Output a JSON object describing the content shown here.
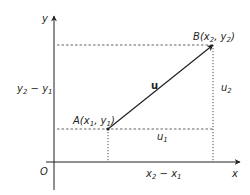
{
  "diagram": {
    "axes": {
      "x_label": "x",
      "y_label": "y",
      "origin_label": "O"
    },
    "points": {
      "A": {
        "name": "A",
        "x_var": "x",
        "x_sub": "1",
        "y_var": "y",
        "y_sub": "1"
      },
      "B": {
        "name": "B",
        "x_var": "x",
        "x_sub": "2",
        "y_var": "y",
        "y_sub": "2"
      }
    },
    "vector_label": "u",
    "components": {
      "u1": {
        "var": "u",
        "sub": "1"
      },
      "u2": {
        "var": "u",
        "sub": "2"
      }
    },
    "differences": {
      "horizontal": {
        "a": "x",
        "a_sub": "2",
        "minus": " − ",
        "b": "x",
        "b_sub": "1"
      },
      "vertical": {
        "a": "y",
        "a_sub": "2",
        "minus": " − ",
        "b": "y",
        "b_sub": "1"
      }
    },
    "colors": {
      "line": "#231f20",
      "background": "#ffffff"
    }
  }
}
